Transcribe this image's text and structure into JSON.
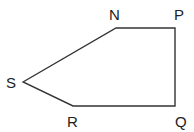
{
  "diagram": {
    "type": "pentagon",
    "vertices": [
      {
        "id": "N",
        "label": "N",
        "x": 116,
        "y": 28,
        "lx": 109,
        "ly": 20
      },
      {
        "id": "P",
        "label": "P",
        "x": 175,
        "y": 28,
        "lx": 174,
        "ly": 20
      },
      {
        "id": "Q",
        "label": "Q",
        "x": 175,
        "y": 106,
        "lx": 175,
        "ly": 127
      },
      {
        "id": "R",
        "label": "R",
        "x": 73,
        "y": 106,
        "lx": 67,
        "ly": 127
      },
      {
        "id": "S",
        "label": "S",
        "x": 23,
        "y": 82,
        "lx": 6,
        "ly": 88
      }
    ],
    "edges": [
      [
        "S",
        "N"
      ],
      [
        "N",
        "P"
      ],
      [
        "P",
        "Q"
      ],
      [
        "Q",
        "R"
      ],
      [
        "R",
        "S"
      ]
    ],
    "stroke_color": "#333333"
  }
}
